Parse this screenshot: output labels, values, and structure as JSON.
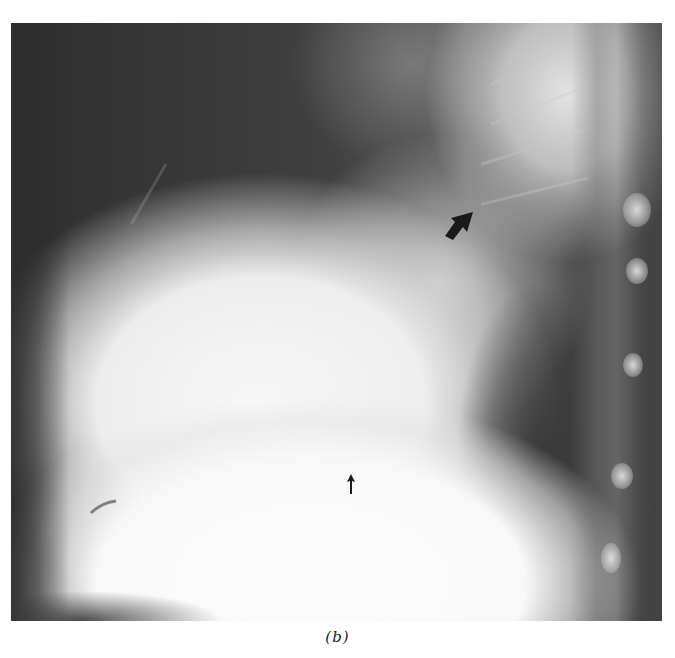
{
  "figure": {
    "panel_label": "(b)",
    "annotations": [
      {
        "name": "curved-arrow",
        "type": "large black arrow",
        "position": "upper-mid near hilum"
      },
      {
        "name": "small-arrow",
        "type": "small black upward arrow",
        "position": "lower-mid above diaphragm"
      }
    ],
    "colors": {
      "background": "#ffffff",
      "film_dark": "#3a3a3a",
      "film_bright": "#f8f8f8",
      "arrow": "#1a1a1a"
    }
  }
}
